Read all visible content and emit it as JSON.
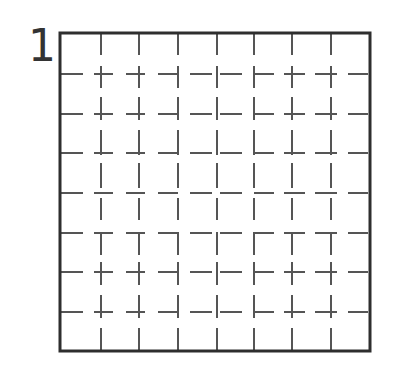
{
  "figure": {
    "label": "1",
    "colors": {
      "border": "#2e2e2e",
      "dash": "#555555",
      "background": "#ffffff"
    },
    "border": {
      "x": 60,
      "y": 33,
      "width": 310,
      "height": 318,
      "stroke_width": 3
    },
    "dash_stroke_width": 2,
    "vertical_line_x": [
      101,
      139,
      178,
      217,
      254,
      292,
      331
    ],
    "horizontal_line_y": [
      74,
      114,
      153,
      193,
      233,
      272,
      312
    ],
    "vertical_dash_segments_y": [
      [
        33,
        55
      ],
      [
        66,
        88
      ],
      [
        97,
        120
      ],
      [
        130,
        155
      ],
      [
        163,
        188
      ],
      [
        198,
        220
      ],
      [
        232,
        255
      ],
      [
        262,
        285
      ],
      [
        295,
        318
      ],
      [
        328,
        351
      ]
    ],
    "horizontal_dash_segments_x": [
      [
        61,
        83
      ],
      [
        94,
        113
      ],
      [
        126,
        145
      ],
      [
        158,
        178
      ],
      [
        190,
        212
      ],
      [
        220,
        242
      ],
      [
        254,
        274
      ],
      [
        284,
        305
      ],
      [
        315,
        337
      ],
      [
        348,
        368
      ]
    ]
  }
}
